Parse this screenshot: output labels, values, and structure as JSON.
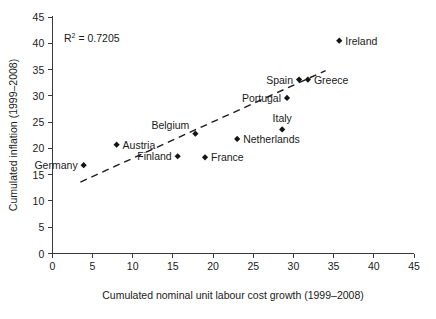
{
  "chart_data": {
    "type": "scatter",
    "title": "",
    "xlabel": "Cumulated nominal unit labour cost growth (1999–2008)",
    "ylabel": "Cumulated inflation (1999–2008)",
    "xlim": [
      0,
      45
    ],
    "ylim": [
      0,
      45
    ],
    "xticks": [
      0,
      5,
      10,
      15,
      20,
      25,
      30,
      35,
      40,
      45
    ],
    "yticks": [
      0,
      5,
      10,
      15,
      20,
      25,
      30,
      35,
      40,
      45
    ],
    "grid": false,
    "legend": "none",
    "annotations": [
      {
        "name": "r2-annotation",
        "text": "R² = 0.7205",
        "value": 0.7205
      }
    ],
    "trendline": {
      "style": "dashed",
      "x_start": 3.5,
      "y_start": 13.6,
      "x_end": 34.0,
      "y_end": 34.8
    },
    "points": [
      {
        "label": "Germany",
        "x": 3.9,
        "y": 16.8,
        "label_pos": "left"
      },
      {
        "label": "Austria",
        "x": 8.0,
        "y": 20.7,
        "label_pos": "right"
      },
      {
        "label": "Finland",
        "x": 15.6,
        "y": 18.5,
        "label_pos": "left"
      },
      {
        "label": "France",
        "x": 19.0,
        "y": 18.3,
        "label_pos": "right"
      },
      {
        "label": "Belgium",
        "x": 17.8,
        "y": 22.8,
        "label_pos": "upper-left"
      },
      {
        "label": "Netherlands",
        "x": 23.0,
        "y": 21.8,
        "label_pos": "right"
      },
      {
        "label": "Italy",
        "x": 28.6,
        "y": 23.6,
        "label_pos": "above"
      },
      {
        "label": "Portugal",
        "x": 29.2,
        "y": 29.6,
        "label_pos": "left"
      },
      {
        "label": "Spain",
        "x": 30.7,
        "y": 33.1,
        "label_pos": "left"
      },
      {
        "label": "Greece",
        "x": 31.8,
        "y": 33.1,
        "label_pos": "right"
      },
      {
        "label": "Ireland",
        "x": 35.7,
        "y": 40.5,
        "label_pos": "right"
      }
    ]
  },
  "figure": {
    "r2_prefix": "R",
    "r2_sup": "2",
    "r2_suffix": " = 0.7205",
    "xlabel": "Cumulated nominal unit labour cost growth (1999–2008)",
    "ylabel": "Cumulated inflation (1999–2008)"
  },
  "colors": {
    "marker": "#141414",
    "axis": "#3a3a3a",
    "text": "#1a1a1a",
    "background": "#ffffff"
  }
}
